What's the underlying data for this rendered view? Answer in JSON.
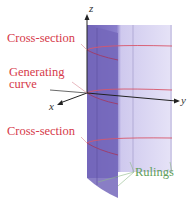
{
  "figure": {
    "labels": {
      "cross_section_top": "Cross-section",
      "generating_curve_line1": "Generating",
      "generating_curve_line2": "curve",
      "cross_section_bottom": "Cross-section",
      "rulings": "Rulings"
    },
    "axes": {
      "x": "x",
      "y": "y",
      "z": "z"
    },
    "colors": {
      "label_red": "#d63a4a",
      "label_green": "#5fa05a",
      "surface_dark": "#7b6fc0",
      "surface_light": "#dcd8f2",
      "cross_section_line": "#d8566a"
    }
  }
}
